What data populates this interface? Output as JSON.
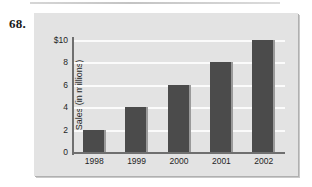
{
  "problem": {
    "number": "68."
  },
  "chart_data": {
    "type": "bar",
    "title": "",
    "xlabel": "",
    "ylabel": "Sales (in millions)",
    "categories": [
      "1998",
      "1999",
      "2000",
      "2001",
      "2002"
    ],
    "values": [
      2,
      4,
      6,
      8,
      10
    ],
    "ylim": [
      0,
      10
    ],
    "ytick_values": [
      0,
      2,
      4,
      6,
      8,
      10
    ],
    "ytick_labels": [
      "0",
      "2",
      "4",
      "6",
      "8",
      "$10"
    ],
    "grid": "horizontal",
    "legend": "none",
    "colors": {
      "panel_background": "#e3e3e3",
      "bar_fill": "#4b4b4b",
      "bar_edge_highlight": "#9a9a9a",
      "gridline": "#fbfbfb",
      "axis": "#6f6f6f",
      "text": "#1f1f1f"
    }
  }
}
